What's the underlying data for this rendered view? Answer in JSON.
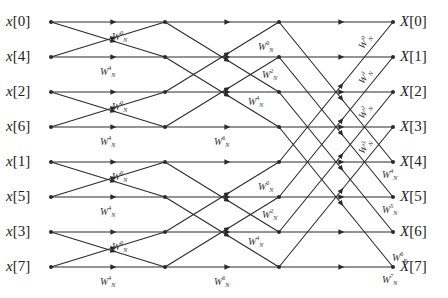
{
  "diagram": {
    "colors": {
      "line": "#2a2a2a",
      "text": "#222222",
      "background": "#ffffff"
    },
    "columns_x": [
      51,
      165,
      279,
      393
    ],
    "rows_y": [
      22,
      57,
      92,
      127,
      162,
      197,
      232,
      267
    ],
    "inputs": [
      "x[0]",
      "x[4]",
      "x[2]",
      "x[6]",
      "x[1]",
      "x[5]",
      "x[3]",
      "x[7]"
    ],
    "outputs": [
      "X[0]",
      "X[1]",
      "X[2]",
      "X[3]",
      "X[4]",
      "X[5]",
      "X[6]",
      "X[7]"
    ],
    "twiddle_base": "W",
    "twiddle_sub": "N",
    "stage1_twiddles": [
      {
        "exp": "0",
        "x": 112,
        "y": 30
      },
      {
        "exp": "4",
        "x": 100,
        "y": 65
      },
      {
        "exp": "0",
        "x": 112,
        "y": 100
      },
      {
        "exp": "4",
        "x": 100,
        "y": 135
      },
      {
        "exp": "0",
        "x": 112,
        "y": 170
      },
      {
        "exp": "4",
        "x": 100,
        "y": 205
      },
      {
        "exp": "0",
        "x": 112,
        "y": 240
      },
      {
        "exp": "4",
        "x": 100,
        "y": 275
      }
    ],
    "stage2_twiddles": [
      {
        "exp": "0",
        "x": 258,
        "y": 40
      },
      {
        "exp": "2",
        "x": 262,
        "y": 68
      },
      {
        "exp": "4",
        "x": 248,
        "y": 95
      },
      {
        "exp": "6",
        "x": 214,
        "y": 135
      },
      {
        "exp": "0",
        "x": 258,
        "y": 180
      },
      {
        "exp": "2",
        "x": 262,
        "y": 208
      },
      {
        "exp": "4",
        "x": 248,
        "y": 235
      },
      {
        "exp": "6",
        "x": 214,
        "y": 275
      }
    ],
    "stage3_twiddles": [
      {
        "exp": "0",
        "x": 355,
        "y": 44,
        "rot": -55
      },
      {
        "exp": "1",
        "x": 355,
        "y": 79,
        "rot": -55
      },
      {
        "exp": "2",
        "x": 355,
        "y": 114,
        "rot": -55
      },
      {
        "exp": "3",
        "x": 355,
        "y": 149,
        "rot": -55
      },
      {
        "exp": "4",
        "x": 382,
        "y": 168,
        "rot": 0
      },
      {
        "exp": "5",
        "x": 382,
        "y": 203,
        "rot": 0
      },
      {
        "exp": "6",
        "x": 392,
        "y": 251,
        "rot": 0
      },
      {
        "exp": "7",
        "x": 382,
        "y": 273,
        "rot": 0
      }
    ]
  }
}
